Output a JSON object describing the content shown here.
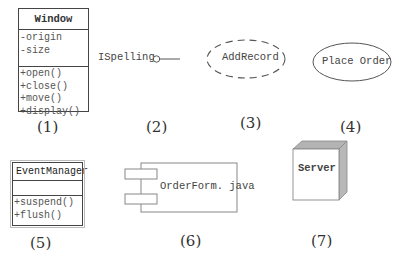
{
  "diagrams": {
    "class_window": {
      "name": "Window",
      "attributes": [
        "-origin",
        "-size"
      ],
      "operations": [
        "+open()",
        "+close()",
        "+move()",
        "+display()"
      ],
      "caption": "(1)"
    },
    "interface": {
      "name": "ISpelling",
      "caption": "(2)"
    },
    "collaboration": {
      "name": "AddRecord",
      "caption": "(3)"
    },
    "use_case": {
      "name": "Place Order",
      "caption": "(4)"
    },
    "active_class": {
      "name": "EventManager",
      "attributes": [],
      "operations": [
        "+suspend()",
        "+flush()"
      ],
      "caption": "(5)"
    },
    "component": {
      "name": "OrderForm. java",
      "caption": "(6)"
    },
    "node": {
      "name": "Server",
      "caption": "(7)"
    }
  }
}
